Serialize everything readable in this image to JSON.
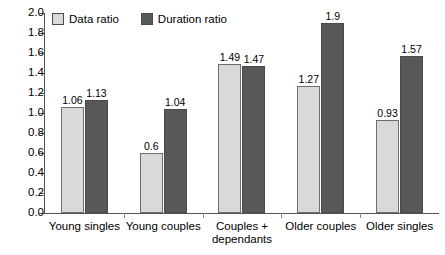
{
  "chart_data": {
    "type": "bar",
    "title": "",
    "subtitle": "",
    "xlabel": "",
    "ylabel": "",
    "ylim": [
      0,
      2.0
    ],
    "ytick_step": 0.2,
    "grid": false,
    "legend_position": "top-left-inside",
    "categories": [
      "Young singles",
      "Young couples",
      "Couples +\ndependants",
      "Older couples",
      "Older singles"
    ],
    "yticks": [
      "0.0",
      "0.2",
      "0.4",
      "0.6",
      "0.8",
      "1.0",
      "1.2",
      "1.4",
      "1.6",
      "1.8",
      "2.0"
    ],
    "series": [
      {
        "name": "Data ratio",
        "color": "#d9d9d9",
        "values": [
          1.06,
          0.6,
          1.49,
          1.27,
          0.93
        ],
        "labels": [
          "1.06",
          "0.6",
          "1.49",
          "1.27",
          "0.93"
        ]
      },
      {
        "name": "Duration ratio",
        "color": "#585858",
        "values": [
          1.13,
          1.04,
          1.47,
          1.9,
          1.57
        ],
        "labels": [
          "1.13",
          "1.04",
          "1.47",
          "1.9",
          "1.57"
        ]
      }
    ]
  },
  "legend": {
    "items": [
      {
        "label": "Data ratio"
      },
      {
        "label": "Duration ratio"
      }
    ]
  },
  "colors": {
    "data_ratio": "#d9d9d9",
    "duration_ratio": "#585858",
    "axis": "#555555",
    "background": "#ffffff"
  }
}
